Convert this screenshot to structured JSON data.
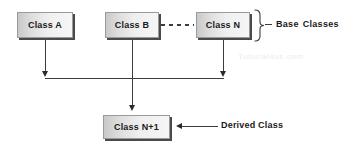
{
  "diagram": {
    "type": "uml-inheritance-diagram",
    "background_color": "#ffffff",
    "line_color": "#3c3c3c",
    "box_border_color": "#9a9a9a",
    "box_shadow_color": "#4a4a4a",
    "text_color": "#1a1a1a"
  },
  "boxes": [
    {
      "id": "class-a",
      "label": "Class A"
    },
    {
      "id": "class-b",
      "label": "Class B"
    },
    {
      "id": "class-n",
      "label": "Class N"
    },
    {
      "id": "class-n1",
      "label": "Class N+1"
    }
  ],
  "annotations": {
    "base_classes": {
      "word1": "Base",
      "word2": "Classes"
    },
    "derived_class": "Derived Class"
  },
  "connectors": {
    "dashed_label": "dashed-ellipsis-connector",
    "brace_label": "base-classes-brace"
  },
  "watermark": "Tutorial4us.com"
}
